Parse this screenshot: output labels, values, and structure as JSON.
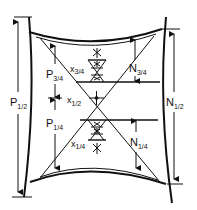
{
  "diagram": {
    "type": "engineering-dimension-diagram",
    "labels": {
      "p_half": {
        "main": "P",
        "sub": "1/2"
      },
      "p_three_quarter": {
        "main": "P",
        "sub": "3/4"
      },
      "p_quarter": {
        "main": "P",
        "sub": "1/4"
      },
      "n_half": {
        "main": "N",
        "sub": "1/2"
      },
      "n_three_quarter": {
        "main": "N",
        "sub": "3/4"
      },
      "n_quarter": {
        "main": "N",
        "sub": "1/4"
      },
      "x_half": {
        "main": "x",
        "sub": "1/2"
      },
      "x_three_quarter": {
        "main": "x",
        "sub": "3/4"
      },
      "x_quarter": {
        "main": "x",
        "sub": "1/4"
      }
    },
    "colors": {
      "line": "#111111",
      "background": "#ffffff"
    }
  }
}
